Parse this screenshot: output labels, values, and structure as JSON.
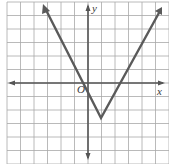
{
  "chart_data": {
    "type": "line",
    "title": "",
    "xlabel": "x",
    "ylabel": "y",
    "origin_label": "O",
    "grid": true,
    "grid_range": {
      "x": [
        -6,
        6
      ],
      "y": [
        -6,
        6
      ]
    },
    "grid_spacing_px": 13.5,
    "origin_px": [
      88,
      83
    ],
    "function_note": "Absolute-value V shape; vertex approx (1, -2.5) read from pixels, between grid lines y=-2 and y=-3 (exact value not confirmed). Left branch crosses y=0 near x=-0.5; right branch near x=2.3.",
    "series": [
      {
        "name": "V-shaped graph (approximate)",
        "points": [
          [
            -3,
            8.5
          ],
          [
            -0.5,
            0
          ],
          [
            1,
            -2.6
          ],
          [
            2.3,
            0
          ],
          [
            6,
            8.5
          ]
        ],
        "vertex_approx": [
          1,
          -2.6
        ],
        "arrows": [
          "upper-left",
          "upper-right"
        ]
      }
    ]
  },
  "labels": {
    "x_axis": "x",
    "y_axis": "y",
    "origin": "O"
  },
  "colors": {
    "grid": "#a8a8a8",
    "axis": "#555555",
    "graph": "#5a5a5a",
    "background": "#ffffff"
  }
}
